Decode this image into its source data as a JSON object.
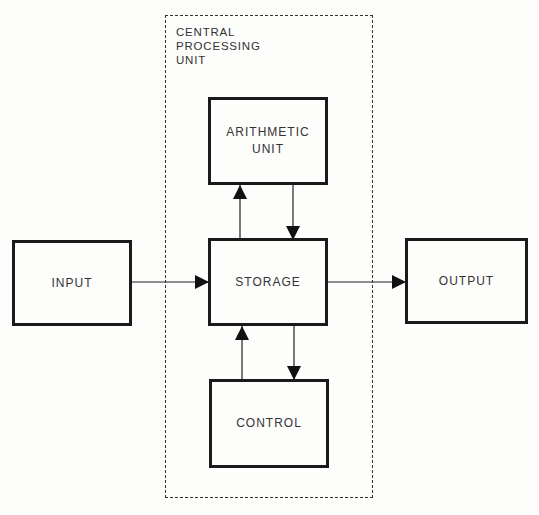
{
  "cpu": {
    "label_lines": [
      "CENTRAL",
      "PROCESSING",
      "UNIT"
    ]
  },
  "blocks": {
    "input": {
      "label": "INPUT"
    },
    "arithmetic": {
      "label_lines": [
        "ARITHMETIC",
        "UNIT"
      ]
    },
    "storage": {
      "label": "STORAGE"
    },
    "control": {
      "label": "CONTROL"
    },
    "output": {
      "label": "OUTPUT"
    }
  },
  "connections": [
    {
      "from": "input",
      "to": "storage"
    },
    {
      "from": "storage",
      "to": "output"
    },
    {
      "from": "storage",
      "to": "arithmetic"
    },
    {
      "from": "arithmetic",
      "to": "storage"
    },
    {
      "from": "control",
      "to": "storage"
    },
    {
      "from": "storage",
      "to": "control"
    }
  ]
}
